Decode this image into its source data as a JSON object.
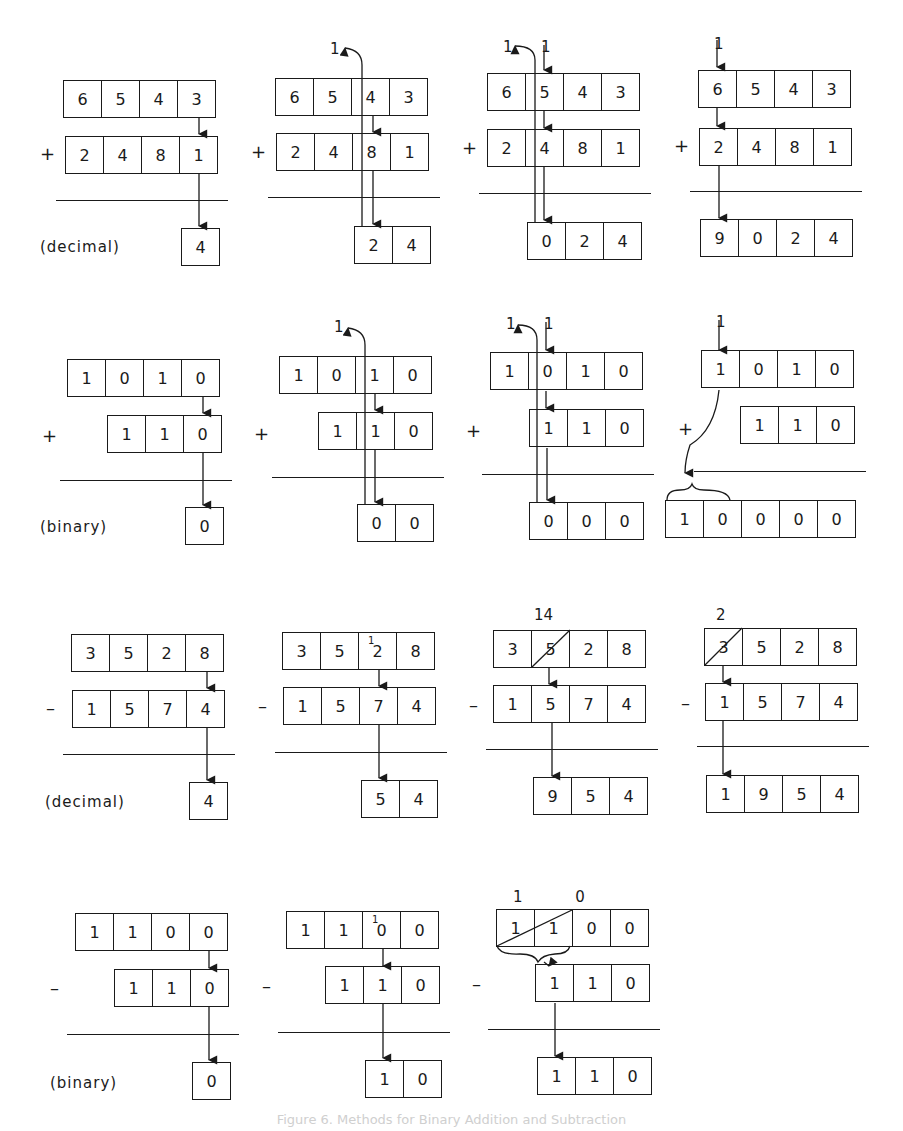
{
  "figure": {
    "caption": "Figure 6. Methods for Binary Addition and Subtraction",
    "row_labels": [
      "(decimal)",
      "(binary)",
      "(decimal)",
      "(binary)"
    ],
    "operators": {
      "add": "+",
      "sub": "–"
    }
  },
  "rows": [
    {
      "name": "decimal-addition",
      "steps": [
        {
          "top": [
            "6",
            "5",
            "4",
            "3"
          ],
          "bottom": [
            "2",
            "4",
            "8",
            "1"
          ],
          "result": [
            "4"
          ],
          "carry_out": "",
          "carry_in": ""
        },
        {
          "top": [
            "6",
            "5",
            "4",
            "3"
          ],
          "bottom": [
            "2",
            "4",
            "8",
            "1"
          ],
          "result": [
            "2",
            "4"
          ],
          "carry_out": "1",
          "carry_in": ""
        },
        {
          "top": [
            "6",
            "5",
            "4",
            "3"
          ],
          "bottom": [
            "2",
            "4",
            "8",
            "1"
          ],
          "result": [
            "0",
            "2",
            "4"
          ],
          "carry_out": "1",
          "carry_in": "1"
        },
        {
          "top": [
            "6",
            "5",
            "4",
            "3"
          ],
          "bottom": [
            "2",
            "4",
            "8",
            "1"
          ],
          "result": [
            "9",
            "0",
            "2",
            "4"
          ],
          "carry_out": "",
          "carry_in": "1"
        }
      ]
    },
    {
      "name": "binary-addition",
      "steps": [
        {
          "top": [
            "1",
            "0",
            "1",
            "0"
          ],
          "bottom": [
            "1",
            "1",
            "0"
          ],
          "result": [
            "0"
          ],
          "carry_out": "",
          "carry_in": ""
        },
        {
          "top": [
            "1",
            "0",
            "1",
            "0"
          ],
          "bottom": [
            "1",
            "1",
            "0"
          ],
          "result": [
            "0",
            "0"
          ],
          "carry_out": "1",
          "carry_in": ""
        },
        {
          "top": [
            "1",
            "0",
            "1",
            "0"
          ],
          "bottom": [
            "1",
            "1",
            "0"
          ],
          "result": [
            "0",
            "0",
            "0"
          ],
          "carry_out": "1",
          "carry_in": "1"
        },
        {
          "top": [
            "1",
            "0",
            "1",
            "0"
          ],
          "bottom": [
            "1",
            "1",
            "0"
          ],
          "result": [
            "1",
            "0",
            "0",
            "0",
            "0"
          ],
          "carry_out": "",
          "carry_in": "1"
        }
      ]
    },
    {
      "name": "decimal-subtraction",
      "steps": [
        {
          "top": [
            "3",
            "5",
            "2",
            "8"
          ],
          "bottom": [
            "1",
            "5",
            "7",
            "4"
          ],
          "result": [
            "4"
          ],
          "borrow_note": ""
        },
        {
          "top": [
            "3",
            "5",
            "2",
            "8"
          ],
          "bottom": [
            "1",
            "5",
            "7",
            "4"
          ],
          "result": [
            "5",
            "4"
          ],
          "borrow_note": "1"
        },
        {
          "top": [
            "3",
            "5",
            "2",
            "8"
          ],
          "bottom": [
            "1",
            "5",
            "7",
            "4"
          ],
          "result": [
            "9",
            "5",
            "4"
          ],
          "borrow_note": "14"
        },
        {
          "top": [
            "3",
            "5",
            "2",
            "8"
          ],
          "bottom": [
            "1",
            "5",
            "7",
            "4"
          ],
          "result": [
            "1",
            "9",
            "5",
            "4"
          ],
          "borrow_note": "2"
        }
      ]
    },
    {
      "name": "binary-subtraction",
      "steps": [
        {
          "top": [
            "1",
            "1",
            "0",
            "0"
          ],
          "bottom": [
            "1",
            "1",
            "0"
          ],
          "result": [
            "0"
          ],
          "borrow_note": ""
        },
        {
          "top": [
            "1",
            "1",
            "0",
            "0"
          ],
          "bottom": [
            "1",
            "1",
            "0"
          ],
          "result": [
            "1",
            "0"
          ],
          "borrow_note": "1"
        },
        {
          "top": [
            "1",
            "1",
            "0",
            "0"
          ],
          "bottom": [
            "1",
            "1",
            "0"
          ],
          "result": [
            "1",
            "1",
            "0"
          ],
          "borrow_note": "1 0"
        }
      ]
    }
  ]
}
